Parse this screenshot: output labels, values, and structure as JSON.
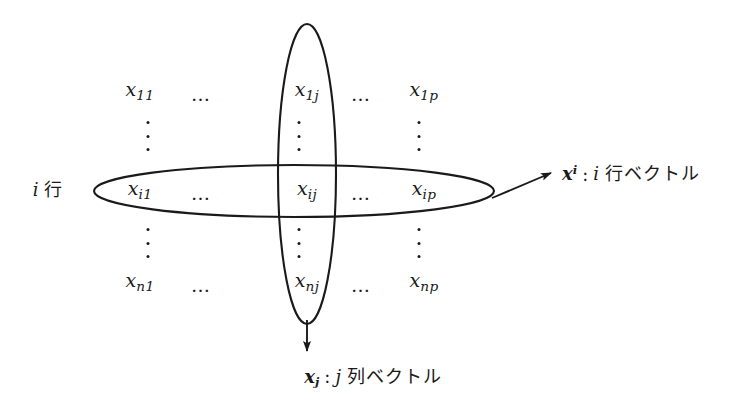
{
  "figure": {
    "background_color": "#ffffff",
    "ink_color": "#1a1a1a"
  },
  "matrix": {
    "rows": [
      {
        "row_key": "1",
        "cells": [
          {
            "base": "x",
            "sub": "11"
          },
          {
            "base": "…",
            "sub": ""
          },
          {
            "base": "x",
            "sub": "1j"
          },
          {
            "base": "…",
            "sub": ""
          },
          {
            "base": "x",
            "sub": "1p"
          }
        ]
      },
      {
        "row_key": "i",
        "cells": [
          {
            "base": "x",
            "sub": "i1"
          },
          {
            "base": "…",
            "sub": ""
          },
          {
            "base": "x",
            "sub": "ij"
          },
          {
            "base": "…",
            "sub": ""
          },
          {
            "base": "x",
            "sub": "ip"
          }
        ]
      },
      {
        "row_key": "n",
        "cells": [
          {
            "base": "x",
            "sub": "n1"
          },
          {
            "base": "…",
            "sub": ""
          },
          {
            "base": "x",
            "sub": "nj"
          },
          {
            "base": "…",
            "sub": ""
          },
          {
            "base": "x",
            "sub": "np"
          }
        ]
      }
    ],
    "entries": {
      "r1c1": "x11",
      "r1c3": "x1j",
      "r1c5": "x1p",
      "r2c1": "xi1",
      "r2c3": "xij",
      "r2c5": "xip",
      "r3c1": "xn1",
      "r3c3": "xnj",
      "r3c5": "xnp"
    },
    "horizontal_ellipsis": "…",
    "vertical_ellipsis": "⋮"
  },
  "labels": {
    "row_marker": {
      "index": "i",
      "unit": "行"
    },
    "row_vector": {
      "symbol": "x",
      "superscript": "i",
      "colon": ":",
      "index": "i",
      "text": "行ベクトル"
    },
    "column_vector": {
      "symbol": "x",
      "subscript": "j",
      "colon": ":",
      "index": "j",
      "text": "列ベクトル"
    }
  },
  "annotations": {
    "row_ellipse": "row-highlight-ellipse",
    "column_ellipse": "column-highlight-ellipse",
    "row_arrow": "row-vector-arrow",
    "column_arrow": "column-vector-arrow"
  }
}
